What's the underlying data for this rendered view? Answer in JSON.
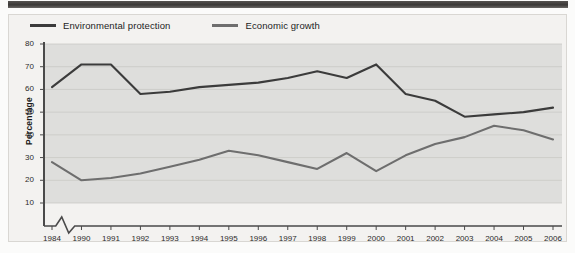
{
  "figure": {
    "background_color": "#f3f2f0",
    "plot_band_color": "#dededc",
    "top_rule_color": "#3a3836"
  },
  "legend": {
    "position": "top-left",
    "entries": [
      {
        "label": "Environmental protection",
        "color": "#3b3b3b",
        "swatch_name": "line-swatch-environmental"
      },
      {
        "label": "Economic growth",
        "color": "#6e6e6e",
        "swatch_name": "line-swatch-economic"
      }
    ]
  },
  "axis": {
    "y_label": "Percentage",
    "y_ticks": [
      "10",
      "20",
      "30",
      "40",
      "50",
      "60",
      "70",
      "80"
    ],
    "x_ticks": [
      "1984",
      "1990",
      "1991",
      "1992",
      "1993",
      "1994",
      "1995",
      "1996",
      "1997",
      "1998",
      "1999",
      "2000",
      "2001",
      "2002",
      "2003",
      "2004",
      "2005",
      "2006"
    ],
    "axis_break": true,
    "axis_break_name": "x-axis-break-zigzag"
  },
  "chart_data": {
    "type": "line",
    "title": "",
    "subtitle": "",
    "xlabel": "",
    "ylabel": "Percentage",
    "ylim": [
      0,
      80
    ],
    "yticks": [
      10,
      20,
      30,
      40,
      50,
      60,
      70,
      80
    ],
    "grid": true,
    "legend_position": "top-left",
    "axis_break_between": [
      "1984",
      "1990"
    ],
    "x": [
      "1984",
      "1990",
      "1991",
      "1992",
      "1993",
      "1994",
      "1995",
      "1996",
      "1997",
      "1998",
      "1999",
      "2000",
      "2001",
      "2002",
      "2003",
      "2004",
      "2005",
      "2006"
    ],
    "series": [
      {
        "name": "Environmental protection",
        "color": "#3b3b3b",
        "values": [
          61,
          71,
          71,
          58,
          59,
          61,
          62,
          63,
          65,
          68,
          65,
          71,
          58,
          55,
          48,
          49,
          50,
          52
        ]
      },
      {
        "name": "Economic growth",
        "color": "#6e6e6e",
        "values": [
          28,
          20,
          21,
          23,
          26,
          29,
          33,
          31,
          28,
          25,
          32,
          24,
          31,
          36,
          39,
          44,
          42,
          38
        ]
      }
    ]
  }
}
